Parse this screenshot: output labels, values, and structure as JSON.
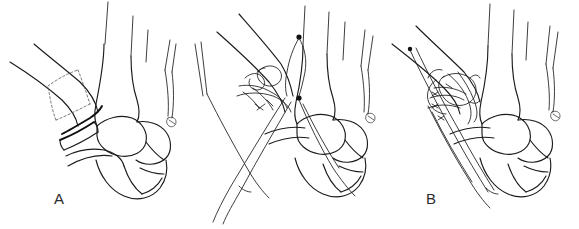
{
  "figure": {
    "kind": "surgical-technique-line-drawing",
    "panel_count": 3,
    "background_color": "#ffffff",
    "ink_color": "#1b1b1b",
    "graft_outline_color": "#555555",
    "width_px": 579,
    "height_px": 229
  },
  "panels": [
    {
      "id": "a",
      "label": "A",
      "caption_text": "A",
      "stage": "graft-harvest-site-outlined",
      "has_dashed_graft_outline": true,
      "has_suture_strands": false,
      "has_fixation_construct": false
    },
    {
      "id": "b",
      "label": "B",
      "caption_text": "B",
      "stage": "suture-wire-passed-tails-long",
      "has_dashed_graft_outline": false,
      "has_suture_strands": true,
      "has_fixation_construct": true
    },
    {
      "id": "c",
      "label": "C",
      "caption_text": "C",
      "stage": "construct-tightened-and-secured",
      "has_dashed_graft_outline": false,
      "has_suture_strands": true,
      "has_fixation_construct": true
    }
  ]
}
